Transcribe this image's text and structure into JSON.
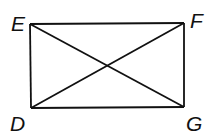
{
  "diagram": {
    "type": "rectangle-with-diagonals",
    "vertices": [
      {
        "label": "E",
        "x": 30,
        "y": 24
      },
      {
        "label": "F",
        "x": 184,
        "y": 23
      },
      {
        "label": "G",
        "x": 184,
        "y": 107
      },
      {
        "label": "D",
        "x": 31,
        "y": 108
      }
    ],
    "sides": [
      "EF",
      "FG",
      "GD",
      "DE"
    ],
    "diagonals": [
      "EG",
      "DF"
    ],
    "stroke_color": "#111111",
    "labels": {
      "E": "E",
      "F": "F",
      "D": "D",
      "G": "G"
    }
  }
}
